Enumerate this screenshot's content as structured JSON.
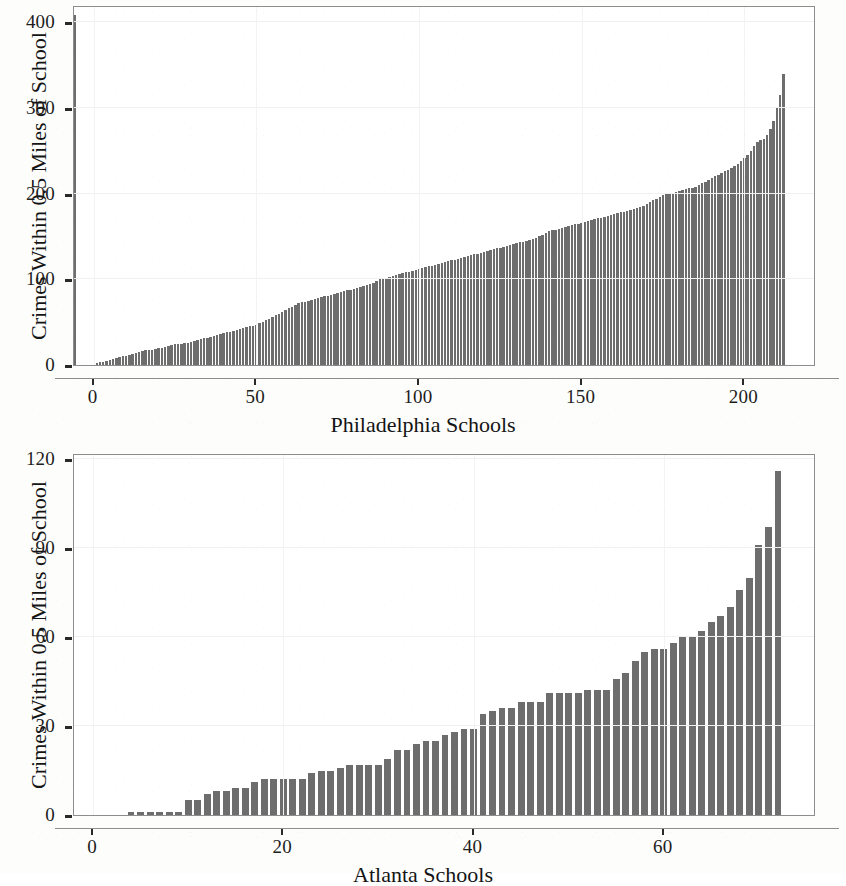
{
  "figure": {
    "background_color": "#fdfdfc",
    "bar_color": "#6d6d6d",
    "axis_color": "#8d8d8d",
    "text_color": "#1a1a1a"
  },
  "chart_data": [
    {
      "type": "bar",
      "id": "philadelphia",
      "title": "",
      "xlabel": "Philadelphia Schools",
      "ylabel": "Crimes Within 0.5 Miles of School",
      "xlim": [
        -6,
        222
      ],
      "ylim": [
        0,
        420
      ],
      "xticks": [
        0,
        50,
        100,
        150,
        200
      ],
      "xticklabels": [
        "0",
        "50",
        "100",
        "150",
        "200"
      ],
      "yticks": [
        0,
        100,
        200,
        300,
        400
      ],
      "yticklabels": [
        "0",
        "100",
        "200",
        "300",
        "400"
      ],
      "grid": true,
      "legend": "none",
      "n_bars": 212,
      "x": [
        1,
        2,
        3,
        4,
        5,
        6,
        7,
        8,
        9,
        10,
        11,
        12,
        13,
        14,
        15,
        16,
        17,
        18,
        19,
        20,
        21,
        22,
        23,
        24,
        25,
        26,
        27,
        28,
        29,
        30,
        31,
        32,
        33,
        34,
        35,
        36,
        37,
        38,
        39,
        40,
        41,
        42,
        43,
        44,
        45,
        46,
        47,
        48,
        49,
        50,
        51,
        52,
        53,
        54,
        55,
        56,
        57,
        58,
        59,
        60,
        61,
        62,
        63,
        64,
        65,
        66,
        67,
        68,
        69,
        70,
        71,
        72,
        73,
        74,
        75,
        76,
        77,
        78,
        79,
        80,
        81,
        82,
        83,
        84,
        85,
        86,
        87,
        88,
        89,
        90,
        91,
        92,
        93,
        94,
        95,
        96,
        97,
        98,
        99,
        100,
        101,
        102,
        103,
        104,
        105,
        106,
        107,
        108,
        109,
        110,
        111,
        112,
        113,
        114,
        115,
        116,
        117,
        118,
        119,
        120,
        121,
        122,
        123,
        124,
        125,
        126,
        127,
        128,
        129,
        130,
        131,
        132,
        133,
        134,
        135,
        136,
        137,
        138,
        139,
        140,
        141,
        142,
        143,
        144,
        145,
        146,
        147,
        148,
        149,
        150,
        151,
        152,
        153,
        154,
        155,
        156,
        157,
        158,
        159,
        160,
        161,
        162,
        163,
        164,
        165,
        166,
        167,
        168,
        169,
        170,
        171,
        172,
        173,
        174,
        175,
        176,
        177,
        178,
        179,
        180,
        181,
        182,
        183,
        184,
        185,
        186,
        187,
        188,
        189,
        190,
        191,
        192,
        193,
        194,
        195,
        196,
        197,
        198,
        199,
        200,
        201,
        202,
        203,
        204,
        205,
        206,
        207,
        208,
        209,
        210,
        211,
        212
      ],
      "values": [
        2,
        3,
        4,
        5,
        6,
        7,
        8,
        9,
        10,
        11,
        12,
        13,
        14,
        15,
        16,
        17,
        17,
        18,
        19,
        20,
        20,
        21,
        22,
        23,
        24,
        24,
        25,
        26,
        26,
        27,
        28,
        29,
        30,
        31,
        32,
        33,
        34,
        35,
        36,
        37,
        38,
        39,
        40,
        41,
        42,
        43,
        44,
        45,
        46,
        47,
        49,
        50,
        52,
        54,
        56,
        58,
        60,
        62,
        64,
        66,
        68,
        70,
        72,
        73,
        74,
        75,
        76,
        77,
        78,
        79,
        80,
        81,
        82,
        83,
        84,
        85,
        86,
        87,
        88,
        89,
        90,
        91,
        92,
        93,
        94,
        96,
        98,
        100,
        101,
        102,
        103,
        104,
        105,
        106,
        107,
        108,
        109,
        110,
        111,
        112,
        113,
        114,
        115,
        116,
        117,
        118,
        119,
        120,
        121,
        122,
        123,
        124,
        125,
        126,
        127,
        128,
        129,
        130,
        131,
        132,
        133,
        134,
        135,
        136,
        137,
        138,
        139,
        140,
        141,
        142,
        143,
        144,
        145,
        146,
        147,
        148,
        150,
        152,
        154,
        156,
        157,
        158,
        159,
        160,
        161,
        162,
        163,
        164,
        165,
        166,
        167,
        168,
        169,
        170,
        171,
        172,
        173,
        174,
        175,
        176,
        177,
        178,
        179,
        180,
        181,
        182,
        183,
        184,
        186,
        188,
        190,
        192,
        194,
        196,
        198,
        200,
        200,
        201,
        202,
        203,
        204,
        205,
        206,
        207,
        208,
        210,
        212,
        214,
        216,
        218,
        220,
        222,
        224,
        226,
        228,
        230,
        232,
        235,
        238,
        241,
        245,
        250,
        255,
        260,
        262,
        264,
        268,
        275,
        285,
        300,
        315,
        340,
        408
      ]
    },
    {
      "type": "bar",
      "id": "atlanta",
      "title": "",
      "xlabel": "Atlanta Schools",
      "ylabel": "Crimes Within 0.5 Miles of School",
      "xlim": [
        -2,
        76
      ],
      "ylim": [
        0,
        122
      ],
      "xticks": [
        0,
        20,
        40,
        60
      ],
      "xticklabels": [
        "0",
        "20",
        "40",
        "60"
      ],
      "yticks": [
        0,
        30,
        60,
        90,
        120
      ],
      "yticklabels": [
        "0",
        "30",
        "60",
        "90",
        "120"
      ],
      "grid": true,
      "legend": "none",
      "n_bars": 69,
      "x": [
        4,
        5,
        6,
        7,
        8,
        9,
        10,
        11,
        12,
        13,
        14,
        15,
        16,
        17,
        18,
        19,
        20,
        21,
        22,
        23,
        24,
        25,
        26,
        27,
        28,
        29,
        30,
        31,
        32,
        33,
        34,
        35,
        36,
        37,
        38,
        39,
        40,
        41,
        42,
        43,
        44,
        45,
        46,
        47,
        48,
        49,
        50,
        51,
        52,
        53,
        54,
        55,
        56,
        57,
        58,
        59,
        60,
        61,
        62,
        63,
        64,
        65,
        66,
        67,
        68,
        69,
        70,
        71,
        72
      ],
      "values": [
        1,
        1,
        1,
        1,
        1,
        1,
        5,
        5,
        7,
        8,
        8,
        9,
        9,
        11,
        12,
        12,
        12,
        12,
        12,
        14,
        15,
        15,
        16,
        17,
        17,
        17,
        17,
        19,
        22,
        22,
        24,
        25,
        25,
        27,
        28,
        29,
        29,
        34,
        35,
        36,
        36,
        38,
        38,
        38,
        41,
        41,
        41,
        41,
        42,
        42,
        42,
        46,
        48,
        52,
        55,
        56,
        56,
        58,
        60,
        60,
        62,
        65,
        67,
        70,
        76,
        80,
        91,
        97,
        116
      ]
    }
  ]
}
